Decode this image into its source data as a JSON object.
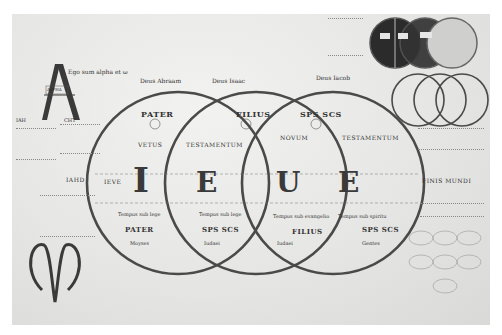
{
  "diagram": {
    "title_line": {
      "alpha_phrase": "Ego sum alpha et ω",
      "deus_abraam": "Deus Abraam",
      "deus_isaac": "Deus Isaac",
      "deus_iacob": "Deus Iacob"
    },
    "alpha_letter": {
      "glyph": "A",
      "inner_label": "ALPHA",
      "left_label": "IAH",
      "right_label": "CHT"
    },
    "omega_letter": {
      "glyph": "ω"
    },
    "circles": [
      {
        "id": "pater",
        "name": "PATER",
        "sub": "IV",
        "upper_label": "VETUS",
        "lower_name": "PATER",
        "lower_note": "Tempus sub lege",
        "bottom_note": "Moyses",
        "letter": "I"
      },
      {
        "id": "filius",
        "name": "FILIUS",
        "sub": "IV",
        "upper_label": "TESTAMENTUM",
        "lower_name": "SPS SCS",
        "lower_note": "Tempus sub lege",
        "bottom_note": "Iudaei",
        "letter": "E"
      },
      {
        "id": "spiritus",
        "name": "SPS SCS",
        "sub": "IV",
        "upper_label": "NOVUM",
        "upper_label_2": "TESTAMENTUM",
        "lower_name": "FILIUS",
        "lower_note": "Tempus sub evangelio",
        "bottom_note": "Iudaei",
        "letter": "U"
      },
      {
        "id": "extra",
        "lower_name": "SPS SCS",
        "lower_note": "Tempus sub spiritu",
        "bottom_note": "Gentes",
        "letter": "E"
      }
    ],
    "side_labels": {
      "left_1": "IAHD",
      "left_2": "IEVE",
      "right": "FINIS MUNDI"
    },
    "small_circles_top_right": {
      "count": 3,
      "style": "dark filled"
    },
    "small_circles_right_mid": {
      "count": 3,
      "style": "outlined interlocking"
    },
    "colors": {
      "parchment": "#e9e9e7",
      "ink": "#3a3a3a",
      "circle_stroke": "#4a4a4a",
      "dark_fill": "#2b2b2b"
    }
  }
}
